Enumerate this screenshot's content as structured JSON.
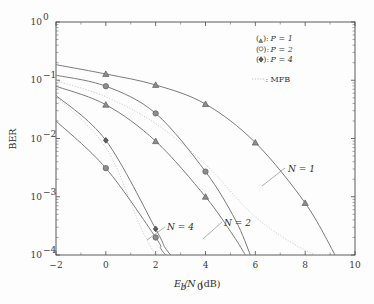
{
  "chart_data": {
    "type": "line",
    "title": "",
    "xlabel": "E_b/N_0 (dB)",
    "ylabel": "BER",
    "xlim": [
      -2,
      10
    ],
    "ylim": [
      0.0001,
      1
    ],
    "yscale": "log",
    "grid": false,
    "legend_position": "top-right",
    "xticks": [
      "-2",
      "0",
      "2",
      "4",
      "6",
      "8",
      "10"
    ],
    "xtick_values": [
      -2,
      0,
      2,
      4,
      6,
      8,
      10
    ],
    "yticks": [
      "10^0",
      "10^-1",
      "10^-2",
      "10^-3",
      "10^-4"
    ],
    "ytick_values": [
      1,
      0.1,
      0.01,
      0.001,
      0.0001
    ],
    "series": [
      {
        "name": "N = 1, P = 1",
        "marker": "triangle",
        "N": 1,
        "P": 1,
        "x": [
          -2,
          0,
          2,
          4,
          6,
          8,
          9.2
        ],
        "y": [
          0.185,
          0.128,
          0.083,
          0.039,
          0.0085,
          0.00078,
          0.0001
        ]
      },
      {
        "name": "N = 1, P = 2",
        "marker": "circle",
        "N": 1,
        "P": 2,
        "x": [
          -2,
          0,
          2,
          4,
          5.2,
          5.8
        ],
        "y": [
          0.122,
          0.079,
          0.027,
          0.0027,
          0.0004,
          0.0001
        ]
      },
      {
        "name": "N = 2, P = 1",
        "marker": "triangle",
        "N": 2,
        "P": 1,
        "x": [
          -2,
          0,
          2,
          4,
          5.1,
          5.6
        ],
        "y": [
          0.079,
          0.038,
          0.009,
          0.001,
          0.00022,
          0.0001
        ]
      },
      {
        "name": "N = 4, P = 4",
        "marker": "diamond",
        "N": 4,
        "P": 4,
        "x": [
          -2,
          0,
          2,
          2.35,
          2.6
        ],
        "y": [
          0.055,
          0.0093,
          0.00028,
          0.00014,
          0.0001
        ]
      },
      {
        "name": "N = 4, P = 2",
        "marker": "circle",
        "N": 4,
        "P": 2,
        "x": [
          -2,
          0,
          2,
          2.2,
          2.4
        ],
        "y": [
          0.02,
          0.0031,
          0.0002,
          0.00013,
          0.0001
        ]
      }
    ],
    "mfb_curves": [
      {
        "name": "MFB (N = 1)",
        "style": "dotted",
        "x": [
          -2,
          0,
          2,
          4,
          6,
          8,
          8.9
        ],
        "y": [
          0.098,
          0.052,
          0.018,
          0.0036,
          0.00045,
          0.00012,
          0.0001
        ]
      },
      {
        "name": "MFB (N = 4)",
        "style": "dotted",
        "x": [
          -2,
          0,
          1.4,
          2.0
        ],
        "y": [
          0.053,
          0.007,
          0.0003,
          0.0001
        ]
      }
    ],
    "annotations": [
      {
        "text": "N = 1",
        "x": 7.55,
        "y": 0.00175
      },
      {
        "text": "N = 2",
        "x": 4.6,
        "y": 0.00026
      },
      {
        "text": "N = 4",
        "x": 2.3,
        "y": 0.00028
      }
    ]
  },
  "legend": {
    "entries": [
      {
        "symbol": "(triangle-marker):",
        "label": "P = 1"
      },
      {
        "symbol": "(circle-marker):",
        "label": "P = 2"
      },
      {
        "symbol": "(diamond-marker):",
        "label": "P = 4"
      }
    ],
    "mfb": {
      "symbol": "dotted-line",
      "label": "MFB"
    },
    "entry_1_prefix": "(",
    "entry_1_suffix": "):",
    "p1_text": "P = 1",
    "p2_text": "P = 2",
    "p4_text": "P = 4",
    "mfb_text": "MFB",
    "mfb_colon": ":"
  },
  "axis": {
    "x_label_main": "E",
    "x_label_sub": "b",
    "x_label_slash": "/N",
    "x_label_sub2": "0",
    "x_label_unit": " (dB)",
    "y_label": "BER",
    "x_tick_0": "−2",
    "x_tick_1": "0",
    "x_tick_2": "2",
    "x_tick_3": "4",
    "x_tick_4": "6",
    "x_tick_5": "8",
    "x_tick_6": "10",
    "y_tick_0_base": "10",
    "y_tick_0_exp": "0",
    "y_tick_1_exp": "−1",
    "y_tick_2_exp": "−2",
    "y_tick_3_exp": "−3",
    "y_tick_4_exp": "−4"
  },
  "annotations": {
    "n1": "N = 1",
    "n2": "N = 2",
    "n4": "N = 4"
  }
}
